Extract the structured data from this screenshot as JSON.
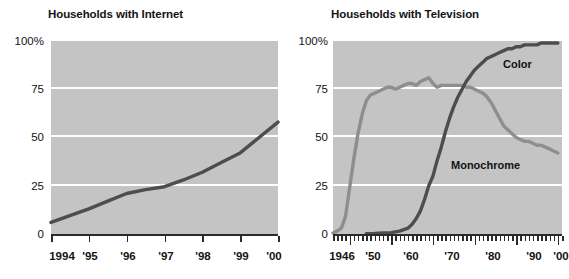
{
  "chart_data": [
    {
      "type": "line",
      "title": "Households with Internet",
      "xlabel": "",
      "ylabel": "",
      "ylim": [
        0,
        100
      ],
      "xlim": [
        1994,
        2000
      ],
      "yticks": [
        0,
        25,
        50,
        75,
        100
      ],
      "ytick_labels": [
        "0",
        "25",
        "50",
        "75",
        "100%"
      ],
      "xticks": [
        1994,
        1995,
        1996,
        1997,
        1998,
        1999,
        2000
      ],
      "xtick_labels": [
        "1994",
        "'95",
        "'96",
        "'97",
        "'98",
        "'99",
        "'00"
      ],
      "grid": "horizontal-white",
      "legend": "none",
      "plot_bgcolor": "#c4c4c4",
      "series": [
        {
          "name": "Internet",
          "color": "#4d4d4d",
          "x": [
            1994,
            1994.5,
            1995,
            1995.5,
            1996,
            1996.5,
            1997,
            1997.5,
            1998,
            1998.5,
            1999,
            1999.5,
            2000
          ],
          "values": [
            6,
            9.5,
            13,
            17,
            21,
            23,
            24.5,
            28,
            32,
            37,
            42,
            50,
            58
          ]
        }
      ]
    },
    {
      "type": "line",
      "title": "Households with Television",
      "xlabel": "",
      "ylabel": "",
      "ylim": [
        0,
        100
      ],
      "xlim": [
        1946,
        2001
      ],
      "yticks": [
        0,
        25,
        50,
        75,
        100
      ],
      "ytick_labels": [
        "0",
        "25",
        "50",
        "75",
        "100%"
      ],
      "xticks": [
        1946,
        1950,
        1960,
        1970,
        1980,
        1990,
        2000
      ],
      "xtick_labels": [
        "1946",
        "'50",
        "'60",
        "'70",
        "'80",
        "'90",
        "'00"
      ],
      "minor_ticks": "annual",
      "grid": "horizontal-white",
      "legend": "inline-annotations",
      "plot_bgcolor": "#c4c4c4",
      "annotations": [
        {
          "text": "Color",
          "x": 1986,
          "y": 89
        },
        {
          "text": "Monochrome",
          "x": 1985,
          "y": 38
        }
      ],
      "series": [
        {
          "name": "Monochrome",
          "color": "#8e8e8e",
          "x": [
            1946,
            1947,
            1948,
            1949,
            1950,
            1951,
            1952,
            1953,
            1954,
            1955,
            1956,
            1957,
            1958,
            1959,
            1960,
            1961,
            1962,
            1963,
            1964,
            1965,
            1966,
            1967,
            1968,
            1969,
            1970,
            1971,
            1972,
            1973,
            1974,
            1975,
            1976,
            1977,
            1978,
            1979,
            1980,
            1981,
            1982,
            1983,
            1984,
            1985,
            1986,
            1987,
            1988,
            1989,
            1990,
            1991,
            1992,
            1993,
            1994,
            1995,
            1996,
            1997,
            1998,
            1999,
            2000
          ],
          "values": [
            0.5,
            1.5,
            3,
            9,
            24,
            39,
            52,
            62,
            69,
            72,
            73,
            74,
            75,
            76,
            76,
            75,
            76,
            77,
            78,
            78,
            77,
            79,
            80,
            81,
            78,
            76,
            77,
            77,
            77,
            77,
            77,
            77,
            76,
            76,
            75,
            74,
            73,
            71,
            68,
            64,
            60,
            56,
            54,
            52,
            50,
            49,
            48,
            48,
            47,
            46,
            46,
            45,
            44,
            43,
            42
          ]
        },
        {
          "name": "Color",
          "color": "#4d4d4d",
          "x": [
            1954,
            1956,
            1958,
            1960,
            1962,
            1964,
            1965,
            1966,
            1967,
            1968,
            1969,
            1970,
            1971,
            1972,
            1973,
            1974,
            1975,
            1976,
            1977,
            1978,
            1979,
            1980,
            1981,
            1982,
            1983,
            1984,
            1985,
            1986,
            1987,
            1988,
            1989,
            1990,
            1991,
            1992,
            1993,
            1994,
            1995,
            1996,
            1997,
            1998,
            1999,
            2000
          ],
          "values": [
            0.2,
            0.3,
            0.5,
            0.7,
            1.5,
            3,
            5,
            8,
            12,
            18,
            25,
            30,
            38,
            45,
            53,
            60,
            66,
            71,
            75,
            79,
            82,
            85,
            87,
            89,
            91,
            92,
            93,
            94,
            95,
            96,
            96,
            97,
            97,
            98,
            98,
            98,
            98,
            99,
            99,
            99,
            99,
            99
          ]
        }
      ]
    }
  ]
}
